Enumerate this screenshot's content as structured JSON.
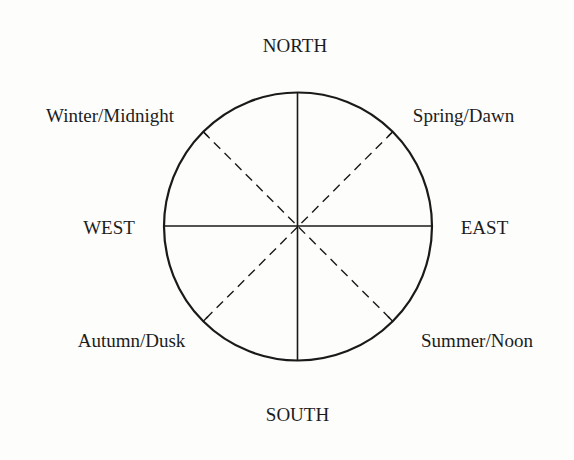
{
  "diagram": {
    "type": "compass-wheel",
    "circle": {
      "cx": 298,
      "cy": 226.5,
      "r": 134,
      "stroke": "#1a1a1a"
    },
    "labels": {
      "north": "NORTH",
      "south": "SOUTH",
      "east": "EAST",
      "west": "WEST",
      "northeast": "Spring/Dawn",
      "southeast": "Summer/Noon",
      "southwest": "Autumn/Dusk",
      "northwest": "Winter/Midnight"
    },
    "lines": {
      "solid": [
        "north-south axis",
        "east-west axis"
      ],
      "dashed": [
        "northeast-southwest diagonal",
        "northwest-southeast diagonal"
      ]
    }
  }
}
